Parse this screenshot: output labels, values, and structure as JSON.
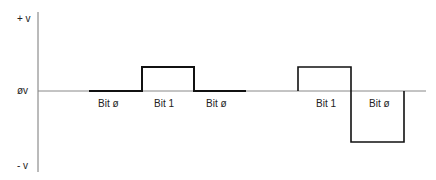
{
  "diagram": {
    "type": "waveform",
    "y_axis_labels": {
      "top": "+ v",
      "middle": "øv",
      "bottom": "- v"
    },
    "bit_labels": [
      {
        "label": "Bit ø",
        "x": 92
      },
      {
        "label": "Bit 1",
        "x": 152
      },
      {
        "label": "Bit ø",
        "x": 203
      },
      {
        "label": "Bit 1",
        "x": 318
      },
      {
        "label": "Bit ø",
        "x": 369
      }
    ],
    "waveform_segments": [
      {
        "bit": "0",
        "level": "0v",
        "x_start": 89,
        "x_end": 142
      },
      {
        "bit": "1",
        "level": "+v",
        "x_start": 142,
        "x_end": 194
      },
      {
        "bit": "0",
        "level": "0v",
        "x_start": 194,
        "x_end": 246
      },
      {
        "bit": "1",
        "level": "+v",
        "x_start": 298,
        "x_end": 351
      },
      {
        "bit": "0",
        "level": "-v",
        "x_start": 351,
        "x_end": 404
      }
    ],
    "colors": {
      "axis": "#777777",
      "signal": "#111111",
      "text": "#222222"
    }
  }
}
